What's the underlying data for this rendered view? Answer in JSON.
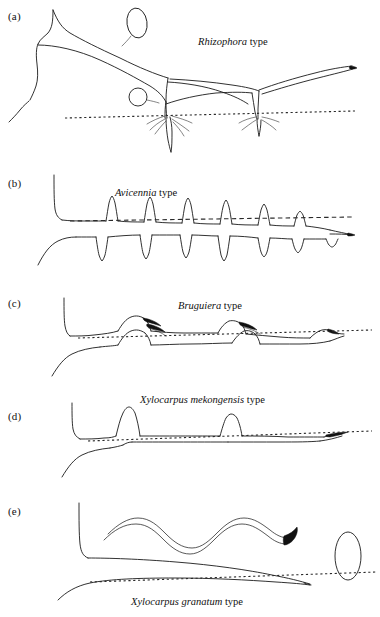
{
  "figure": {
    "width": 380,
    "height": 617,
    "background_color": "#ffffff",
    "ink_color": "#1a1a1a"
  },
  "panels": [
    {
      "letter": "(a)",
      "label_genus": "Rhizophora",
      "label_suffix": " type",
      "label_x": 198,
      "label_y": 36,
      "letter_x": 8,
      "letter_y": 10,
      "root_type": "prop-roots",
      "description": "Arching stilt/prop roots descending from trunk into substrate with fine rootlets below the soil line",
      "soil_line_y": 114
    },
    {
      "letter": "(b)",
      "label_genus": "Avicennia",
      "label_suffix": " type",
      "label_x": 115,
      "label_y": 189,
      "letter_x": 8,
      "letter_y": 177,
      "root_type": "pneumatophores",
      "description": "Horizontal cable root bearing upright pencil-like pneumatophores above the soil line and downward anchor roots below",
      "soil_line_y": 220,
      "pneumatophore_count": 7,
      "anchor_root_count": 7
    },
    {
      "letter": "(c)",
      "label_genus": "Bruguiera",
      "label_suffix": " type",
      "label_x": 178,
      "label_y": 303,
      "letter_x": 8,
      "letter_y": 297,
      "root_type": "knee-roots",
      "description": "Cable root forming looping knee roots that emerge above the soil line with dark claw-like rootlets",
      "soil_line_y": 335,
      "knee_count": 3
    },
    {
      "letter": "(d)",
      "label_genus": "Xylocarpus mekongensis",
      "label_suffix": " type",
      "label_x": 140,
      "label_y": 396,
      "letter_x": 8,
      "letter_y": 410,
      "root_type": "peg-roots",
      "description": "Cable root with narrow conical peg roots projecting above the soil line",
      "soil_line_y": 435,
      "peg_count": 2
    },
    {
      "letter": "(e)",
      "label_genus": "Xylocarpus granatum",
      "label_suffix": " type",
      "label_x": 131,
      "label_y": 598,
      "letter_x": 8,
      "letter_y": 505,
      "root_type": "plank-buttress-roots",
      "description": "Sinuous ribbon-like plank/buttress root shown in plan view above, with the tapering root profile and cross-section ellipse at right",
      "soil_line_y": 575
    }
  ],
  "annotations": {
    "soil_surface_style": "dotted horizontal line indicating substrate surface",
    "cross_section_shape": "ellipse",
    "lateral_root_tip": "dark tapered tip"
  }
}
